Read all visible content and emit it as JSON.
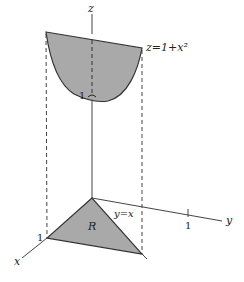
{
  "figure": {
    "type": "3d-region-diagram",
    "colors": {
      "fill": "#a9a9a9",
      "stroke": "#333333",
      "axis": "#444444",
      "background": "#ffffff"
    },
    "axes": {
      "x_label": "x",
      "y_label": "y",
      "z_label": "z"
    },
    "surface": {
      "equation_label": "z=1+x²",
      "min_label": "1"
    },
    "region": {
      "name": "R",
      "boundary_label": "y=x",
      "x_tick_label": "1",
      "y_tick_label": "1"
    }
  }
}
